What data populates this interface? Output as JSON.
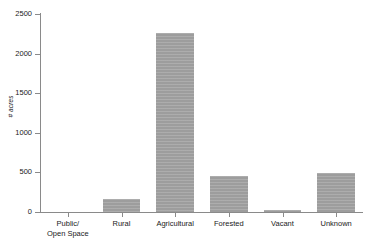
{
  "chart_data": {
    "type": "bar",
    "title": "",
    "subtitle": "",
    "xlabel": "",
    "ylabel": "# acres",
    "categories": [
      "Public/\nOpen Space",
      "Rural",
      "Agricultural",
      "Forested",
      "Vacant",
      "Unknown"
    ],
    "category_labels_flat": [
      "Public/ Open Space",
      "Rural",
      "Agricultural",
      "Forested",
      "Vacant",
      "Unknown"
    ],
    "values": [
      0,
      170,
      2260,
      460,
      25,
      490
    ],
    "ylim": [
      0,
      2500
    ],
    "xlim_note": "categorical",
    "ytick_values": [
      0,
      500,
      1000,
      1500,
      2000,
      2500
    ],
    "ytick_labels": [
      "0",
      "500",
      "1000",
      "1500",
      "2000",
      "2500"
    ],
    "grid": false,
    "legend": false,
    "legend_position": "none",
    "bar_color": "#9d9d9d",
    "axis_color": "#8a8a8a",
    "text_color": "#1a1a1a",
    "background_color": "#ffffff",
    "annotations": []
  },
  "axis": {
    "y_title": "# acres"
  }
}
